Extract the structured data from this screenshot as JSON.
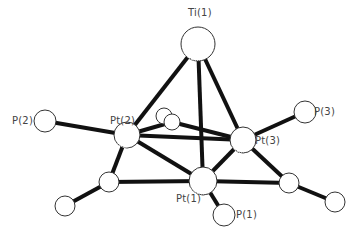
{
  "diagram": {
    "type": "molecular-structure",
    "atoms": [
      {
        "id": "Ti1",
        "label": "Ti(1)",
        "x": 198,
        "y": 44,
        "r": 17,
        "shaded": true
      },
      {
        "id": "Pt2",
        "label": "Pt(2)",
        "x": 127,
        "y": 135,
        "r": 13,
        "shaded": true
      },
      {
        "id": "Pt3",
        "label": "Pt(3)",
        "x": 243,
        "y": 140,
        "r": 13,
        "shaded": true
      },
      {
        "id": "Pt1",
        "label": "Pt(1)",
        "x": 203,
        "y": 181,
        "r": 14,
        "shaded": true
      },
      {
        "id": "P2",
        "label": "P(2)",
        "x": 45,
        "y": 121,
        "r": 11,
        "shaded": false
      },
      {
        "id": "P3",
        "label": "P(3)",
        "x": 305,
        "y": 112,
        "r": 11,
        "shaded": false
      },
      {
        "id": "P1",
        "label": "P(1)",
        "x": 224,
        "y": 215,
        "r": 11,
        "shaded": false
      },
      {
        "id": "Cb1",
        "label": "",
        "x": 164,
        "y": 116,
        "r": 8,
        "shaded": false
      },
      {
        "id": "Cb2",
        "label": "",
        "x": 172,
        "y": 122,
        "r": 8,
        "shaded": false
      },
      {
        "id": "Cl",
        "label": "",
        "x": 109,
        "y": 182,
        "r": 10,
        "shaded": false
      },
      {
        "id": "Cll",
        "label": "",
        "x": 65,
        "y": 206,
        "r": 10,
        "shaded": false
      },
      {
        "id": "Cr",
        "label": "",
        "x": 289,
        "y": 183,
        "r": 10,
        "shaded": false
      },
      {
        "id": "Crr",
        "label": "",
        "x": 335,
        "y": 202,
        "r": 10,
        "shaded": false
      }
    ],
    "bonds": [
      [
        "Ti1",
        "Pt2"
      ],
      [
        "Ti1",
        "Pt3"
      ],
      [
        "Ti1",
        "Pt1"
      ],
      [
        "Pt2",
        "Pt3"
      ],
      [
        "Pt2",
        "Pt1"
      ],
      [
        "Pt3",
        "Pt1"
      ],
      [
        "P2",
        "Pt2"
      ],
      [
        "P3",
        "Pt3"
      ],
      [
        "P1",
        "Pt1"
      ],
      [
        "Pt2",
        "Cb2"
      ],
      [
        "Cb2",
        "Pt3"
      ],
      [
        "Pt2",
        "Cl"
      ],
      [
        "Cl",
        "Pt1"
      ],
      [
        "Cl",
        "Cll"
      ],
      [
        "Pt3",
        "Cr"
      ],
      [
        "Cr",
        "Pt1"
      ],
      [
        "Cr",
        "Crr"
      ]
    ],
    "labels": [
      {
        "text": "Ti(1)",
        "x": 188,
        "y": 8
      },
      {
        "text": "P(2)",
        "x": 12,
        "y": 116
      },
      {
        "text": "Pt(2)",
        "x": 110,
        "y": 116
      },
      {
        "text": "P(3)",
        "x": 314,
        "y": 107
      },
      {
        "text": "Pt(3)",
        "x": 255,
        "y": 136
      },
      {
        "text": "Pt(1)",
        "x": 176,
        "y": 194
      },
      {
        "text": "P(1)",
        "x": 236,
        "y": 210
      }
    ]
  }
}
